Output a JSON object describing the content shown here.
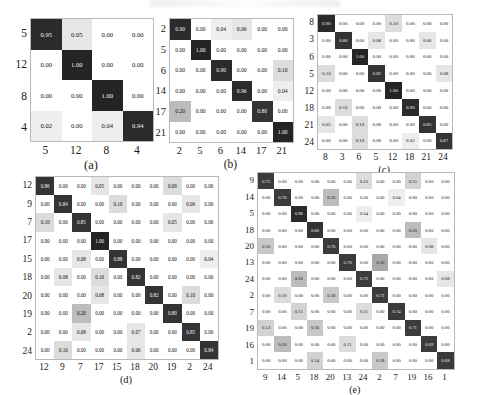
{
  "figure": {
    "type": "confusion-matrix-grid",
    "panel_count": 5
  },
  "colors": {
    "diagonal_dark": "#2b2b2b",
    "zero_cell": "#ffffff",
    "low_value_cell": "#e3e3e3",
    "mid_value_cell": "#b5b5b5",
    "border": "#b9b9b9",
    "text_dark": "#111111",
    "text_light": "#f2f2f2",
    "page_background": "#ffffff"
  },
  "panels": [
    {
      "id": "a",
      "caption": "(a)",
      "size": 4,
      "row_labels": [
        "5",
        "12",
        "8",
        "4"
      ],
      "col_labels": [
        "5",
        "12",
        "8",
        "4"
      ],
      "values": [
        [
          "0.95",
          "0.05",
          "0.00",
          "0.00"
        ],
        [
          "0.00",
          "1.00",
          "0.00",
          "0.00"
        ],
        [
          "0.00",
          "0.00",
          "1.00",
          "0.00"
        ],
        [
          "0.02",
          "0.00",
          "0.04",
          "0.94"
        ]
      ]
    },
    {
      "id": "b",
      "caption": "(b)",
      "size": 6,
      "row_labels": [
        "2",
        "5",
        "6",
        "14",
        "17",
        "21"
      ],
      "col_labels": [
        "2",
        "5",
        "6",
        "14",
        "17",
        "21"
      ],
      "values": [
        [
          "0.90",
          "0.00",
          "0.04",
          "0.06",
          "0.00",
          "0.00"
        ],
        [
          "0.00",
          "1.00",
          "0.00",
          "0.00",
          "0.00",
          "0.00"
        ],
        [
          "0.00",
          "0.00",
          "0.90",
          "0.00",
          "0.00",
          "0.10"
        ],
        [
          "0.00",
          "0.00",
          "0.00",
          "0.96",
          "0.00",
          "0.04"
        ],
        [
          "0.20",
          "0.00",
          "0.00",
          "0.00",
          "0.80",
          "0.00"
        ],
        [
          "0.00",
          "0.00",
          "0.00",
          "0.00",
          "0.00",
          "1.00"
        ]
      ]
    },
    {
      "id": "c",
      "caption": "(c)",
      "size": 8,
      "row_labels": [
        "8",
        "3",
        "6",
        "5",
        "12",
        "18",
        "21",
        "24"
      ],
      "col_labels": [
        "8",
        "3",
        "6",
        "5",
        "12",
        "18",
        "21",
        "24"
      ],
      "values": [
        [
          "0.90",
          "0.00",
          "0.00",
          "0.00",
          "0.10",
          "0.00",
          "0.00",
          "0.00"
        ],
        [
          "0.00",
          "0.86",
          "0.00",
          "0.08",
          "0.00",
          "0.00",
          "0.06",
          "0.00"
        ],
        [
          "0.00",
          "0.00",
          "1.00",
          "0.00",
          "0.00",
          "0.00",
          "0.00",
          "0.00"
        ],
        [
          "0.10",
          "0.00",
          "0.00",
          "0.82",
          "0.00",
          "0.00",
          "0.00",
          "0.08"
        ],
        [
          "0.00",
          "0.00",
          "0.00",
          "0.00",
          "1.00",
          "0.00",
          "0.00",
          "0.00"
        ],
        [
          "0.00",
          "0.10",
          "0.00",
          "0.00",
          "0.00",
          "0.90",
          "0.00",
          "0.00"
        ],
        [
          "0.05",
          "0.00",
          "0.10",
          "0.00",
          "0.00",
          "0.00",
          "0.85",
          "0.00"
        ],
        [
          "0.00",
          "0.00",
          "0.10",
          "0.00",
          "0.00",
          "0.03",
          "0.00",
          "0.87"
        ]
      ]
    },
    {
      "id": "d",
      "caption": "(d)",
      "size": 10,
      "row_labels": [
        "12",
        "9",
        "7",
        "17",
        "15",
        "18",
        "20",
        "19",
        "2",
        "24"
      ],
      "col_labels": [
        "12",
        "9",
        "7",
        "17",
        "15",
        "18",
        "20",
        "19",
        "2",
        "24"
      ],
      "values": [
        [
          "0.86",
          "0.00",
          "0.00",
          "0.05",
          "0.00",
          "0.00",
          "0.00",
          "0.09",
          "0.00",
          "0.00"
        ],
        [
          "0.00",
          "0.84",
          "0.00",
          "0.00",
          "0.10",
          "0.00",
          "0.00",
          "0.00",
          "0.06",
          "0.00"
        ],
        [
          "0.10",
          "0.00",
          "0.85",
          "0.00",
          "0.00",
          "0.00",
          "0.00",
          "0.05",
          "0.00",
          "0.00"
        ],
        [
          "0.00",
          "0.00",
          "0.00",
          "1.00",
          "0.00",
          "0.00",
          "0.00",
          "0.00",
          "0.00",
          "0.00"
        ],
        [
          "0.00",
          "0.00",
          "0.08",
          "0.00",
          "0.88",
          "0.00",
          "0.00",
          "0.00",
          "0.00",
          "0.04"
        ],
        [
          "0.00",
          "0.08",
          "0.00",
          "0.10",
          "0.00",
          "0.82",
          "0.00",
          "0.00",
          "0.00",
          "0.00"
        ],
        [
          "0.00",
          "0.00",
          "0.00",
          "0.08",
          "0.00",
          "0.00",
          "0.82",
          "0.00",
          "0.10",
          "0.00"
        ],
        [
          "0.00",
          "0.00",
          "0.20",
          "0.00",
          "0.00",
          "0.00",
          "0.00",
          "0.80",
          "0.00",
          "0.00"
        ],
        [
          "0.00",
          "0.00",
          "0.08",
          "0.00",
          "0.00",
          "0.07",
          "0.00",
          "0.00",
          "0.85",
          "0.00"
        ],
        [
          "0.00",
          "0.10",
          "0.00",
          "0.00",
          "0.00",
          "0.06",
          "0.00",
          "0.00",
          "0.00",
          "0.84"
        ]
      ]
    },
    {
      "id": "e",
      "caption": "(e)",
      "size": 12,
      "row_labels": [
        "9",
        "14",
        "5",
        "18",
        "20",
        "13",
        "24",
        "2",
        "7",
        "19",
        "16",
        "1"
      ],
      "col_labels": [
        "9",
        "14",
        "5",
        "18",
        "20",
        "13",
        "24",
        "2",
        "7",
        "19",
        "16",
        "1"
      ],
      "values": [
        [
          "0.75",
          "0.00",
          "0.00",
          "0.00",
          "0.00",
          "0.00",
          "0.10",
          "0.00",
          "0.00",
          "0.15",
          "0.00",
          "0.00"
        ],
        [
          "0.00",
          "0.76",
          "0.00",
          "0.00",
          "0.20",
          "0.00",
          "0.00",
          "0.00",
          "0.04",
          "0.00",
          "0.00",
          "0.00"
        ],
        [
          "0.00",
          "0.00",
          "0.96",
          "0.00",
          "0.00",
          "0.00",
          "0.04",
          "0.00",
          "0.00",
          "0.00",
          "0.00",
          "0.00"
        ],
        [
          "0.00",
          "0.00",
          "0.00",
          "0.80",
          "0.00",
          "0.00",
          "0.00",
          "0.00",
          "0.00",
          "0.20",
          "0.00",
          "0.00"
        ],
        [
          "0.16",
          "0.00",
          "0.00",
          "0.00",
          "0.76",
          "0.00",
          "0.00",
          "0.00",
          "0.00",
          "0.00",
          "0.08",
          "0.00"
        ],
        [
          "0.00",
          "0.00",
          "0.00",
          "0.00",
          "0.00",
          "0.70",
          "0.00",
          "0.30",
          "0.00",
          "0.00",
          "0.00",
          "0.00"
        ],
        [
          "0.00",
          "0.00",
          "0.20",
          "0.00",
          "0.00",
          "0.00",
          "0.72",
          "0.00",
          "0.00",
          "0.00",
          "0.00",
          "0.08"
        ],
        [
          "0.00",
          "0.10",
          "0.00",
          "0.00",
          "0.18",
          "0.00",
          "0.00",
          "0.72",
          "0.00",
          "0.00",
          "0.00",
          "0.00"
        ],
        [
          "0.00",
          "0.00",
          "0.15",
          "0.00",
          "0.00",
          "0.00",
          "0.11",
          "0.00",
          "0.74",
          "0.00",
          "0.00",
          "0.00"
        ],
        [
          "0.13",
          "0.00",
          "0.00",
          "0.16",
          "0.00",
          "0.00",
          "0.00",
          "0.00",
          "0.00",
          "0.71",
          "0.00",
          "0.00"
        ],
        [
          "0.00",
          "0.20",
          "0.00",
          "0.00",
          "0.00",
          "0.11",
          "0.00",
          "0.00",
          "0.00",
          "0.00",
          "0.69",
          "0.00"
        ],
        [
          "0.00",
          "0.00",
          "0.00",
          "0.14",
          "0.00",
          "0.00",
          "0.00",
          "0.18",
          "0.00",
          "0.00",
          "0.00",
          "0.68"
        ]
      ]
    }
  ]
}
